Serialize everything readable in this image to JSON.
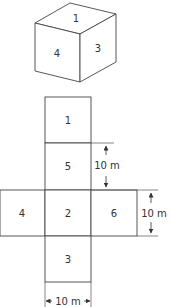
{
  "cube": {
    "faces": {
      "top": "1",
      "left": "4",
      "right": "3"
    }
  },
  "net": {
    "squares": [
      {
        "label": "1",
        "position": "column-row-1"
      },
      {
        "label": "5",
        "position": "column-row-2"
      },
      {
        "label": "4",
        "position": "left-of-row-3"
      },
      {
        "label": "2",
        "position": "column-row-3"
      },
      {
        "label": "6",
        "position": "right-of-row-3"
      },
      {
        "label": "3",
        "position": "column-row-4"
      }
    ],
    "dimensions": {
      "face5_height": "10 m",
      "face6_height": "10 m",
      "column_width": "10 m"
    }
  }
}
